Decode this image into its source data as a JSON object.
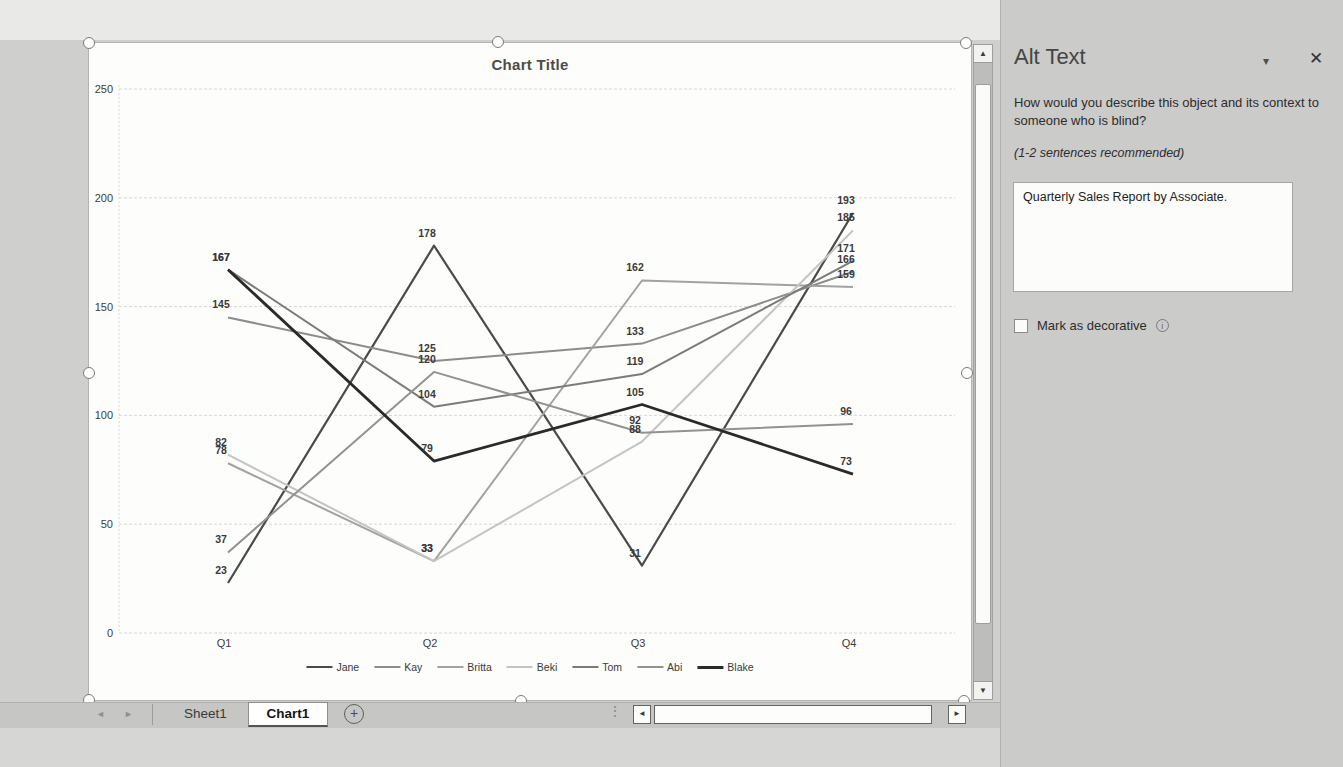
{
  "chart_data": {
    "type": "line",
    "title": "Chart Title",
    "categories": [
      "Q1",
      "Q2",
      "Q3",
      "Q4"
    ],
    "series": [
      {
        "name": "Jane",
        "values": [
          23,
          178,
          31,
          193
        ],
        "color": "#4a4a48",
        "width": 2.2
      },
      {
        "name": "Kay",
        "values": [
          145,
          125,
          133,
          166
        ],
        "color": "#8c8c8a",
        "width": 2
      },
      {
        "name": "Britta",
        "values": [
          78,
          33,
          162,
          159
        ],
        "color": "#a2a2a0",
        "width": 2
      },
      {
        "name": "Beki",
        "values": [
          82,
          33,
          88,
          185
        ],
        "color": "#c4c4c2",
        "width": 2
      },
      {
        "name": "Tom",
        "values": [
          167,
          104,
          119,
          171
        ],
        "color": "#7b7b79",
        "width": 2
      },
      {
        "name": "Abi",
        "values": [
          37,
          120,
          92,
          96
        ],
        "color": "#929290",
        "width": 2
      },
      {
        "name": "Blake",
        "values": [
          167,
          79,
          105,
          73
        ],
        "color": "#2a2a28",
        "width": 2.8
      }
    ],
    "y_axis": {
      "min": 0,
      "max": 250,
      "step": 50
    },
    "grid": true,
    "data_labels": true,
    "legend_position": "bottom"
  },
  "sheet_bar": {
    "prev_icon": "◄",
    "next_icon": "►",
    "tabs": {
      "sheet1": "Sheet1",
      "chart1": "Chart1"
    },
    "new_sheet_icon": "+",
    "grip_icon": "⋮"
  },
  "scrollbars": {
    "up_icon": "▲",
    "down_icon": "▼",
    "left_icon": "◄",
    "right_icon": "►"
  },
  "alt_text_panel": {
    "title": "Alt Text",
    "menu_icon": "▾",
    "close_icon": "✕",
    "question": "How would you describe this object and its context to someone who is blind?",
    "hint": "(1-2 sentences recommended)",
    "description": "Quarterly Sales Report by Associate.",
    "decorative_label": "Mark as decorative",
    "info_icon": "i"
  }
}
